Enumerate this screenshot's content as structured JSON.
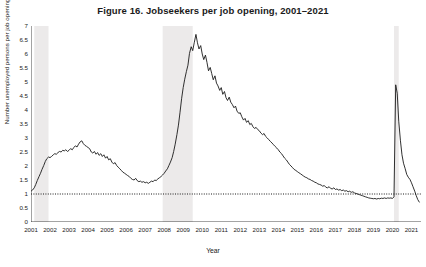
{
  "chart_data": {
    "type": "line",
    "title": "Figure 16.  Jobseekers per job opening, 2001–2021",
    "xlabel": "Year",
    "ylabel": "Number unemployed persons per job opening",
    "xlim": [
      2001.0,
      2021.5
    ],
    "ylim": [
      0,
      7
    ],
    "ytick_labels": [
      "0",
      "0.5",
      "1",
      "1.5",
      "2",
      "2.5",
      "3",
      "3.5",
      "4",
      "4.5",
      "5",
      "5.5",
      "6",
      "6.5",
      "7"
    ],
    "ytick_values": [
      0,
      0.5,
      1,
      1.5,
      2,
      2.5,
      3,
      3.5,
      4,
      4.5,
      5,
      5.5,
      6,
      6.5,
      7
    ],
    "xtick_labels": [
      "2001",
      "2002",
      "2003",
      "2004",
      "2005",
      "2006",
      "2007",
      "2008",
      "2009",
      "2010",
      "2011",
      "2012",
      "2013",
      "2014",
      "2015",
      "2016",
      "2017",
      "2018",
      "2019",
      "2020",
      "2021"
    ],
    "xtick_values": [
      2001,
      2002,
      2003,
      2004,
      2005,
      2006,
      2007,
      2008,
      2009,
      2010,
      2011,
      2012,
      2013,
      2014,
      2015,
      2016,
      2017,
      2018,
      2019,
      2020,
      2021
    ],
    "grid": false,
    "legend": "none",
    "line_color": "#1a1a1a",
    "reference_line": {
      "y": 1.0,
      "style": "dotted",
      "color": "#1a1a1a"
    },
    "shaded_bands": [
      {
        "label": "recession-2001",
        "x0": 2001.17,
        "x1": 2001.92,
        "color": "#eceaea"
      },
      {
        "label": "recession-2007-2009",
        "x0": 2007.92,
        "x1": 2009.5,
        "color": "#eceaea"
      },
      {
        "label": "recession-2020",
        "x0": 2020.08,
        "x1": 2020.33,
        "color": "#eceaea"
      }
    ],
    "series": [
      {
        "name": "Jobseekers per job opening",
        "x": [
          2001.0,
          2001.08,
          2001.17,
          2001.25,
          2001.33,
          2001.42,
          2001.5,
          2001.58,
          2001.67,
          2001.75,
          2001.83,
          2001.92,
          2002.0,
          2002.08,
          2002.17,
          2002.25,
          2002.33,
          2002.42,
          2002.5,
          2002.58,
          2002.67,
          2002.75,
          2002.83,
          2002.92,
          2003.0,
          2003.08,
          2003.17,
          2003.25,
          2003.33,
          2003.42,
          2003.5,
          2003.58,
          2003.67,
          2003.75,
          2003.83,
          2003.92,
          2004.0,
          2004.08,
          2004.17,
          2004.25,
          2004.33,
          2004.42,
          2004.5,
          2004.58,
          2004.67,
          2004.75,
          2004.83,
          2004.92,
          2005.0,
          2005.08,
          2005.17,
          2005.25,
          2005.33,
          2005.42,
          2005.5,
          2005.58,
          2005.67,
          2005.75,
          2005.83,
          2005.92,
          2006.0,
          2006.08,
          2006.17,
          2006.25,
          2006.33,
          2006.42,
          2006.5,
          2006.58,
          2006.67,
          2006.75,
          2006.83,
          2006.92,
          2007.0,
          2007.08,
          2007.17,
          2007.25,
          2007.33,
          2007.42,
          2007.5,
          2007.58,
          2007.67,
          2007.75,
          2007.83,
          2007.92,
          2008.0,
          2008.08,
          2008.17,
          2008.25,
          2008.33,
          2008.42,
          2008.5,
          2008.58,
          2008.67,
          2008.75,
          2008.83,
          2008.92,
          2009.0,
          2009.08,
          2009.17,
          2009.25,
          2009.33,
          2009.42,
          2009.5,
          2009.58,
          2009.67,
          2009.75,
          2009.83,
          2009.92,
          2010.0,
          2010.08,
          2010.17,
          2010.25,
          2010.33,
          2010.42,
          2010.5,
          2010.58,
          2010.67,
          2010.75,
          2010.83,
          2010.92,
          2011.0,
          2011.08,
          2011.17,
          2011.25,
          2011.33,
          2011.42,
          2011.5,
          2011.58,
          2011.67,
          2011.75,
          2011.83,
          2011.92,
          2012.0,
          2012.08,
          2012.17,
          2012.25,
          2012.33,
          2012.42,
          2012.5,
          2012.58,
          2012.67,
          2012.75,
          2012.83,
          2012.92,
          2013.0,
          2013.08,
          2013.17,
          2013.25,
          2013.33,
          2013.42,
          2013.5,
          2013.58,
          2013.67,
          2013.75,
          2013.83,
          2013.92,
          2014.0,
          2014.08,
          2014.17,
          2014.25,
          2014.33,
          2014.42,
          2014.5,
          2014.58,
          2014.67,
          2014.75,
          2014.83,
          2014.92,
          2015.0,
          2015.08,
          2015.17,
          2015.25,
          2015.33,
          2015.42,
          2015.5,
          2015.58,
          2015.67,
          2015.75,
          2015.83,
          2015.92,
          2016.0,
          2016.08,
          2016.17,
          2016.25,
          2016.33,
          2016.42,
          2016.5,
          2016.58,
          2016.67,
          2016.75,
          2016.83,
          2016.92,
          2017.0,
          2017.08,
          2017.17,
          2017.25,
          2017.33,
          2017.42,
          2017.5,
          2017.58,
          2017.67,
          2017.75,
          2017.83,
          2017.92,
          2018.0,
          2018.08,
          2018.17,
          2018.25,
          2018.33,
          2018.42,
          2018.5,
          2018.58,
          2018.67,
          2018.75,
          2018.83,
          2018.92,
          2019.0,
          2019.08,
          2019.17,
          2019.25,
          2019.33,
          2019.42,
          2019.5,
          2019.58,
          2019.67,
          2019.75,
          2019.83,
          2019.92,
          2020.0,
          2020.08,
          2020.17,
          2020.25,
          2020.33,
          2020.42,
          2020.5,
          2020.58,
          2020.67,
          2020.75,
          2020.83,
          2020.92,
          2021.0,
          2021.08,
          2021.17,
          2021.25,
          2021.33,
          2021.42
        ],
        "y": [
          1.1,
          1.14,
          1.22,
          1.34,
          1.48,
          1.62,
          1.74,
          1.88,
          2.02,
          2.16,
          2.26,
          2.32,
          2.3,
          2.34,
          2.4,
          2.44,
          2.42,
          2.48,
          2.52,
          2.5,
          2.56,
          2.54,
          2.58,
          2.52,
          2.56,
          2.62,
          2.58,
          2.66,
          2.72,
          2.68,
          2.78,
          2.86,
          2.9,
          2.8,
          2.74,
          2.7,
          2.66,
          2.62,
          2.5,
          2.46,
          2.52,
          2.42,
          2.48,
          2.38,
          2.44,
          2.34,
          2.4,
          2.28,
          2.34,
          2.22,
          2.26,
          2.14,
          2.08,
          2.12,
          2.02,
          1.96,
          1.9,
          1.84,
          1.78,
          1.74,
          1.7,
          1.66,
          1.62,
          1.56,
          1.52,
          1.5,
          1.56,
          1.48,
          1.44,
          1.46,
          1.42,
          1.44,
          1.4,
          1.42,
          1.38,
          1.42,
          1.46,
          1.44,
          1.5,
          1.48,
          1.54,
          1.58,
          1.62,
          1.68,
          1.74,
          1.82,
          1.9,
          2.02,
          2.14,
          2.3,
          2.52,
          2.78,
          3.12,
          3.46,
          3.9,
          4.42,
          4.8,
          5.1,
          5.38,
          5.6,
          6.02,
          6.26,
          6.12,
          6.4,
          6.7,
          6.4,
          6.18,
          6.3,
          6.0,
          5.8,
          5.96,
          5.7,
          5.4,
          5.52,
          5.3,
          5.08,
          5.22,
          4.96,
          4.86,
          4.7,
          4.8,
          4.56,
          4.66,
          4.44,
          4.34,
          4.46,
          4.28,
          4.2,
          4.08,
          4.14,
          3.96,
          3.88,
          3.9,
          3.76,
          3.64,
          3.7,
          3.56,
          3.62,
          3.48,
          3.52,
          3.4,
          3.34,
          3.38,
          3.3,
          3.26,
          3.18,
          3.12,
          3.16,
          3.06,
          3.0,
          2.94,
          2.88,
          2.82,
          2.76,
          2.7,
          2.64,
          2.58,
          2.5,
          2.44,
          2.36,
          2.28,
          2.22,
          2.14,
          2.06,
          2.0,
          1.94,
          1.88,
          1.84,
          1.8,
          1.76,
          1.72,
          1.68,
          1.64,
          1.6,
          1.58,
          1.54,
          1.52,
          1.48,
          1.46,
          1.42,
          1.4,
          1.36,
          1.34,
          1.32,
          1.28,
          1.3,
          1.24,
          1.22,
          1.26,
          1.2,
          1.18,
          1.22,
          1.16,
          1.18,
          1.14,
          1.16,
          1.12,
          1.14,
          1.1,
          1.12,
          1.08,
          1.1,
          1.06,
          1.08,
          1.04,
          1.02,
          1.0,
          0.98,
          0.96,
          0.94,
          0.92,
          0.9,
          0.88,
          0.86,
          0.85,
          0.84,
          0.83,
          0.84,
          0.82,
          0.84,
          0.83,
          0.85,
          0.84,
          0.86,
          0.84,
          0.86,
          0.85,
          0.86,
          0.84,
          0.9,
          4.9,
          4.6,
          3.6,
          2.9,
          2.4,
          2.1,
          1.9,
          1.7,
          1.6,
          1.52,
          1.4,
          1.26,
          1.1,
          0.94,
          0.8,
          0.7
        ]
      }
    ]
  }
}
